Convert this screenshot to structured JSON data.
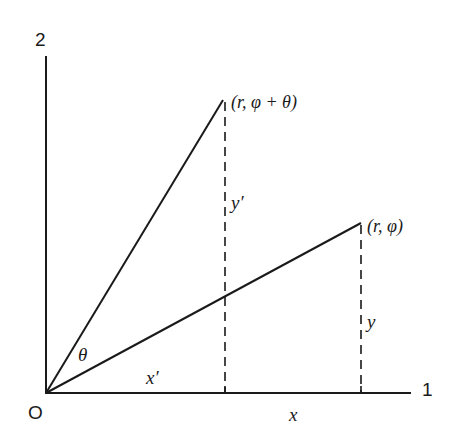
{
  "diagram": {
    "axis_labels": {
      "x_axis_end": "1",
      "y_axis_end": "2",
      "origin": "O"
    },
    "points": {
      "rotated": {
        "label": "(r, φ + θ)",
        "r": "r",
        "angle": "φ + θ"
      },
      "original": {
        "label": "(r, φ)",
        "r": "r",
        "angle": "φ"
      }
    },
    "segment_labels": {
      "angle": "θ",
      "x_prime": "x′",
      "y_prime": "y′",
      "x": "x",
      "y": "y"
    },
    "colors": {
      "line": "#1a1a1a",
      "background": "#ffffff"
    }
  }
}
